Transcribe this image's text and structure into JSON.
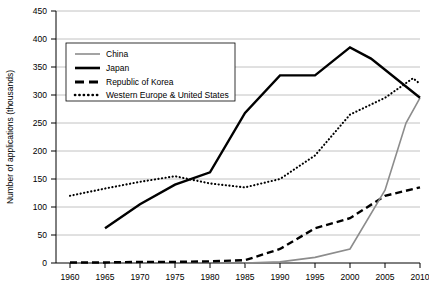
{
  "chart_data": {
    "type": "line",
    "title": "",
    "xlabel": "",
    "ylabel": "Number of applications (thousands)",
    "xlim": [
      1960,
      2010
    ],
    "ylim": [
      0,
      450
    ],
    "xticks": [
      1960,
      1965,
      1970,
      1975,
      1980,
      1985,
      1990,
      1995,
      2000,
      2005,
      2010
    ],
    "yticks": [
      0,
      50,
      100,
      150,
      200,
      250,
      300,
      350,
      400,
      450
    ],
    "grid": "horizontal",
    "legend_position": "upper-left-inside",
    "series": [
      {
        "name": "China",
        "style": "solid-thin-gray",
        "color": "#8c8c8c",
        "x": [
          1985,
          1990,
          1995,
          2000,
          2005,
          2008,
          2010
        ],
        "values": [
          0,
          2,
          10,
          25,
          130,
          250,
          295
        ]
      },
      {
        "name": "Japan",
        "style": "solid-thick-black",
        "color": "#000000",
        "x": [
          1965,
          1970,
          1975,
          1980,
          1985,
          1990,
          1995,
          2000,
          2003,
          2010
        ],
        "values": [
          62,
          105,
          140,
          162,
          268,
          335,
          335,
          385,
          365,
          295
        ]
      },
      {
        "name": "Republic of Korea",
        "style": "dashed-black",
        "color": "#000000",
        "x": [
          1960,
          1965,
          1970,
          1975,
          1980,
          1985,
          1990,
          1995,
          2000,
          2005,
          2010
        ],
        "values": [
          1,
          1,
          2,
          2,
          3,
          5,
          25,
          62,
          80,
          120,
          135
        ]
      },
      {
        "name": "Western Europe & United States",
        "style": "dotted-black",
        "color": "#000000",
        "x": [
          1960,
          1965,
          1970,
          1975,
          1980,
          1985,
          1990,
          1995,
          2000,
          2005,
          2009,
          2010
        ],
        "values": [
          120,
          133,
          145,
          155,
          142,
          135,
          150,
          192,
          265,
          295,
          330,
          320
        ]
      }
    ]
  },
  "legend": {
    "items": [
      {
        "label": "China"
      },
      {
        "label": "Japan"
      },
      {
        "label": "Republic of Korea"
      },
      {
        "label": "Western Europe & United States"
      }
    ]
  },
  "axes": {
    "y_title": "Number of applications (thousands)",
    "y_tick_labels": [
      "450",
      "400",
      "350",
      "300",
      "250",
      "200",
      "150",
      "100",
      "50",
      "0"
    ],
    "x_tick_labels": [
      "1960",
      "1965",
      "1970",
      "1975",
      "1980",
      "1985",
      "1990",
      "1995",
      "2000",
      "2005",
      "2010"
    ]
  }
}
